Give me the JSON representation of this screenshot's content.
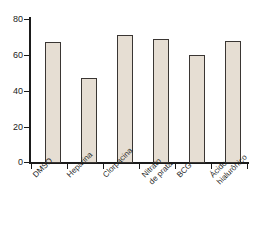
{
  "chart_data": {
    "type": "bar",
    "title": "",
    "subtitle": "",
    "xlabel": "",
    "ylabel": "",
    "categories": [
      "DMSO",
      "Heparina",
      "Clorpacina",
      "Nitrato\nde prata",
      "BCG",
      "Ácido\nhialurônico"
    ],
    "values": [
      67,
      47,
      71,
      69,
      60,
      68
    ],
    "ylim": [
      0,
      80
    ],
    "yticks": [
      0,
      20,
      40,
      60,
      80
    ],
    "ytick_labels": [
      "0",
      "20",
      "40",
      "60",
      "80"
    ],
    "grid": false,
    "legend": null,
    "legend_position": "none",
    "annotations": [],
    "series": [
      {
        "name": "",
        "values": [
          67,
          47,
          71,
          69,
          60,
          68
        ]
      }
    ]
  },
  "style": {
    "bar_fill": "#e6ded3",
    "bar_border": "#3a3633",
    "axis_color": "#1b1b1b",
    "text_color": "#1f1f1f",
    "background": "#ffffff"
  }
}
